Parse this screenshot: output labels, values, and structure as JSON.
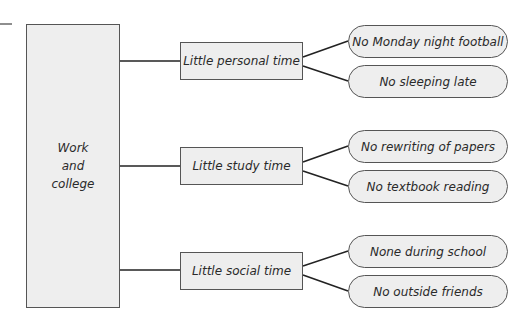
{
  "root": {
    "lines": [
      "Work",
      "and",
      "college"
    ]
  },
  "branches": [
    {
      "label": "Little personal time",
      "leaves": [
        "No Monday night football",
        "No sleeping late"
      ]
    },
    {
      "label": "Little study time",
      "leaves": [
        "No rewriting of papers",
        "No textbook reading"
      ]
    },
    {
      "label": "Little social time",
      "leaves": [
        "None during school",
        "No outside friends"
      ]
    }
  ],
  "colors": {
    "box_fill": "#eeeeee",
    "stroke": "#555555",
    "line": "#222222"
  }
}
